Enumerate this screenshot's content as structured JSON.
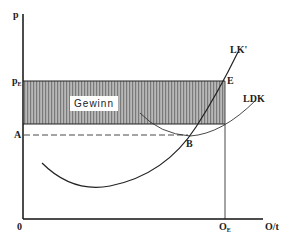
{
  "diagram": {
    "axes": {
      "y_label": "p",
      "x_label": "O/t",
      "origin_label": "0"
    },
    "y_ticks": [
      {
        "label": "p",
        "sub": "E",
        "name": "price-equilibrium"
      },
      {
        "label": "A",
        "sub": "",
        "name": "average-cost-minimum"
      }
    ],
    "x_ticks": [
      {
        "label": "O",
        "sub": "E",
        "name": "quantity-equilibrium"
      }
    ],
    "curves": [
      {
        "label": "LK'",
        "name": "marginal-cost-curve"
      },
      {
        "label": "LDK",
        "name": "average-cost-curve"
      }
    ],
    "points": [
      {
        "label": "E",
        "name": "equilibrium-point"
      },
      {
        "label": "B",
        "name": "cost-minimum-point"
      }
    ],
    "shaded_area": {
      "label": "Gewinn",
      "fill_color": "#9a9a9a"
    },
    "colors": {
      "line": "#222222",
      "background": "#ffffff"
    }
  }
}
